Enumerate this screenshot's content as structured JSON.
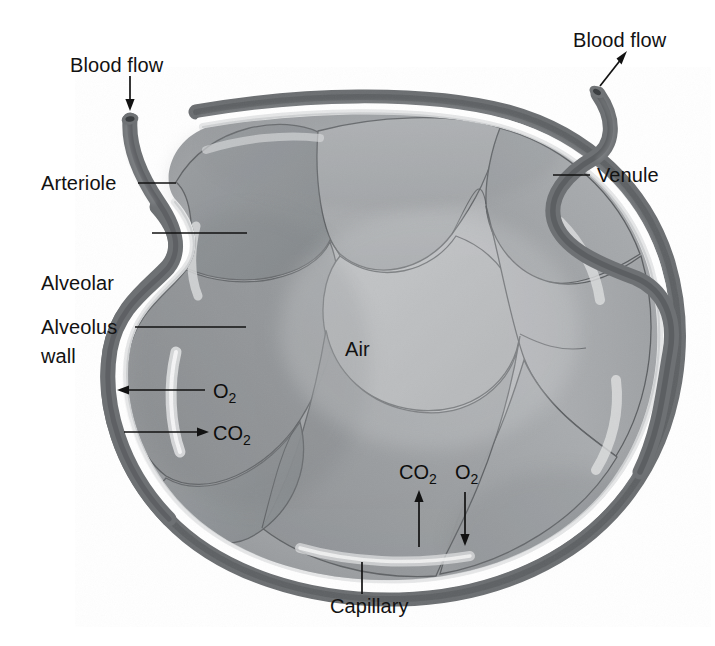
{
  "labels": {
    "blood_flow_in": "Blood flow",
    "blood_flow_out": "Blood flow",
    "arteriole": "Arteriole",
    "alveolar_wall_line1": "Alveolar",
    "alveolar_wall_line2": "wall",
    "alveolus": "Alveolus",
    "venule": "Venule",
    "capillary": "Capillary",
    "air": "Air"
  },
  "gas_labels": {
    "o2_left": "O",
    "o2_left_sub": "2",
    "co2_left": "CO",
    "co2_left_sub": "2",
    "co2_bottom": "CO",
    "co2_bottom_sub": "2",
    "o2_bottom": "O",
    "o2_bottom_sub": "2"
  },
  "arrows": {
    "blood_flow_in_direction": "down",
    "blood_flow_out_direction": "up-right",
    "o2_left_direction": "left",
    "co2_left_direction": "right",
    "co2_bottom_direction": "up",
    "o2_bottom_direction": "down"
  },
  "colors": {
    "ink": "#121212",
    "vessel_dark": "#6f7174",
    "vessel_edge": "#4a4c4f",
    "lumen": "#3d3f42",
    "alveolus_mid": "#a9abad",
    "alveolus_dark": "#8d9093",
    "alveolus_light": "#bcbec0",
    "wall_light": "#e9eaeb",
    "background": "#ffffff",
    "cell_outline": "#5d6063"
  }
}
